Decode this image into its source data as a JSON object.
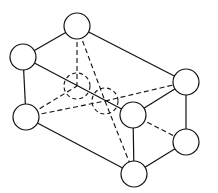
{
  "diagram": {
    "type": "crystal-lattice-unit-cell",
    "atom_radius": 13,
    "atoms": [
      {
        "id": "top",
        "x": 77,
        "y": 26,
        "style": "solid"
      },
      {
        "id": "upper-left",
        "x": 23,
        "y": 57,
        "style": "solid"
      },
      {
        "id": "lower-left",
        "x": 26,
        "y": 117,
        "style": "solid"
      },
      {
        "id": "right-upper",
        "x": 186,
        "y": 82,
        "style": "solid"
      },
      {
        "id": "right-lower",
        "x": 186,
        "y": 142,
        "style": "solid"
      },
      {
        "id": "front-middle",
        "x": 133,
        "y": 115,
        "style": "solid"
      },
      {
        "id": "bottom",
        "x": 134,
        "y": 174,
        "style": "solid"
      },
      {
        "id": "back-left",
        "x": 77,
        "y": 86,
        "style": "dashed"
      },
      {
        "id": "back-center",
        "x": 105,
        "y": 101,
        "style": "dashed"
      }
    ],
    "solid_bonds": [
      [
        "top",
        "upper-left"
      ],
      [
        "top",
        "right-upper"
      ],
      [
        "upper-left",
        "lower-left"
      ],
      [
        "upper-left",
        "front-middle"
      ],
      [
        "lower-left",
        "bottom"
      ],
      [
        "right-upper",
        "right-lower"
      ],
      [
        "right-upper",
        "front-middle"
      ],
      [
        "right-lower",
        "bottom"
      ],
      [
        "front-middle",
        "bottom"
      ]
    ],
    "dashed_bonds": [
      [
        "top",
        "back-left"
      ],
      [
        "top",
        "back-center"
      ],
      [
        "lower-left",
        "back-left"
      ],
      [
        "lower-left",
        "back-center"
      ],
      [
        "back-center",
        "right-upper"
      ],
      [
        "back-center",
        "bottom"
      ],
      [
        "front-middle",
        "right-lower"
      ]
    ]
  }
}
